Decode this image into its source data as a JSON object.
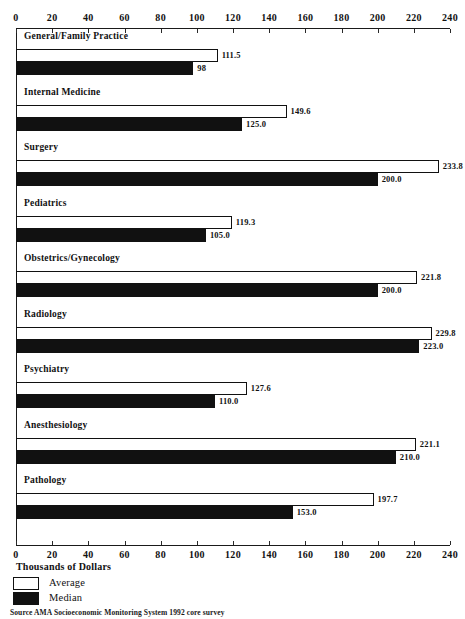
{
  "chart_data": {
    "type": "bar",
    "orientation": "horizontal",
    "title": "",
    "xlabel": "Thousands of Dollars",
    "ylabel": "",
    "xlim": [
      0,
      240
    ],
    "xticks": [
      0,
      20,
      40,
      60,
      80,
      100,
      120,
      140,
      160,
      180,
      200,
      220,
      240
    ],
    "grid": false,
    "legend_position": "bottom-left",
    "categories": [
      "General/Family Practice",
      "Internal Medicine",
      "Surgery",
      "Pediatrics",
      "Obstetrics/Gynecology",
      "Radiology",
      "Psychiatry",
      "Anesthesiology",
      "Pathology"
    ],
    "series": [
      {
        "name": "Average",
        "color": "#ffffff",
        "values": [
          111.5,
          149.6,
          233.8,
          119.3,
          221.8,
          229.8,
          127.6,
          221.1,
          197.7
        ],
        "labels": [
          "111.5",
          "149.6",
          "233.8",
          "119.3",
          "221.8",
          "229.8",
          "127.6",
          "221.1",
          "197.7"
        ]
      },
      {
        "name": "Median",
        "color": "#111111",
        "values": [
          98.0,
          125.0,
          200.0,
          105.0,
          200.0,
          223.0,
          110.0,
          210.0,
          153.0
        ],
        "labels": [
          "98",
          "125.0",
          "200.0",
          "105.0",
          "200.0",
          "223.0",
          "110.0",
          "210.0",
          "153.0"
        ]
      }
    ]
  },
  "axis": {
    "caption": "Thousands of Dollars",
    "tick_labels": [
      "0",
      "20",
      "40",
      "60",
      "80",
      "100",
      "120",
      "140",
      "160",
      "180",
      "200",
      "220",
      "240"
    ]
  },
  "legend": {
    "items": [
      {
        "label": "Average",
        "swatch": "white-square-icon"
      },
      {
        "label": "Median",
        "swatch": "black-square-icon"
      }
    ]
  },
  "footer": {
    "source": "Source  AMA Socioeconomic Monitoring System 1992 core survey"
  }
}
